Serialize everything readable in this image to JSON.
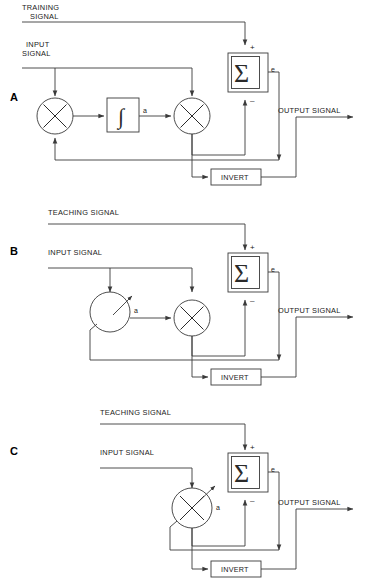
{
  "figure": {
    "type": "block-diagram",
    "panel_count": 3,
    "line_color": "#3a3a3a",
    "background_color": "#ffffff"
  },
  "panels": [
    {
      "id": "A",
      "letter": "A",
      "labels": {
        "training_line1": "TRAINING",
        "training_line2": "SIGNAL",
        "input_line1": "INPUT",
        "input_line2": "SIGNAL",
        "output": "OUTPUT SIGNAL",
        "error": "e",
        "gain": "a",
        "plus": "+",
        "minus": "–"
      },
      "blocks": [
        {
          "name": "multiplier-left",
          "symbol": "✕",
          "shape": "circle"
        },
        {
          "name": "integrator",
          "symbol": "∫",
          "shape": "rect"
        },
        {
          "name": "multiplier-right",
          "symbol": "✕",
          "shape": "circle"
        },
        {
          "name": "summing-junction",
          "symbol": "Σ",
          "shape": "double-rect"
        },
        {
          "name": "invert",
          "symbol": "INVERT",
          "shape": "rect"
        }
      ],
      "invert_label": "INVERT"
    },
    {
      "id": "B",
      "letter": "B",
      "labels": {
        "teaching": "TEACHING SIGNAL",
        "input": "INPUT SIGNAL",
        "output": "OUTPUT SIGNAL",
        "error": "e",
        "gain": "a",
        "plus": "+",
        "minus": "–"
      },
      "blocks": [
        {
          "name": "adjustable-gain",
          "symbol": "",
          "shape": "circle-with-arrow"
        },
        {
          "name": "multiplier",
          "symbol": "✕",
          "shape": "circle"
        },
        {
          "name": "summing-junction",
          "symbol": "Σ",
          "shape": "double-rect"
        },
        {
          "name": "invert",
          "symbol": "INVERT",
          "shape": "rect"
        }
      ],
      "invert_label": "INVERT"
    },
    {
      "id": "C",
      "letter": "C",
      "labels": {
        "teaching": "TEACHING SIGNAL",
        "input": "INPUT SIGNAL",
        "output": "OUTPUT SIGNAL",
        "error": "e",
        "gain": "a",
        "plus": "+",
        "minus": "–"
      },
      "blocks": [
        {
          "name": "adjustable-multiplier",
          "symbol": "✕",
          "shape": "circle-with-arrow"
        },
        {
          "name": "summing-junction",
          "symbol": "Σ",
          "shape": "double-rect"
        },
        {
          "name": "invert",
          "symbol": "INVERT",
          "shape": "rect"
        }
      ],
      "invert_label": "INVERT"
    }
  ]
}
